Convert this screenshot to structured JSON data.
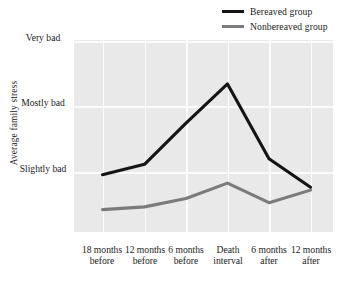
{
  "chart_data": {
    "type": "line",
    "title": "",
    "subtitle": "",
    "xlabel": "",
    "ylabel": "Average family stress",
    "grid": true,
    "legend_position": "top-right",
    "categories": [
      "18 months before",
      "12 months before",
      "6 months before",
      "Death interval",
      "6 months after",
      "12 months after"
    ],
    "x_tick_lines": [
      [
        "18 months",
        "before"
      ],
      [
        "12 months",
        "before"
      ],
      [
        "6 months",
        "before"
      ],
      [
        "Death",
        "interval"
      ],
      [
        "6 months",
        "after"
      ],
      [
        "12 months",
        "after"
      ]
    ],
    "y_tick_lines": [
      [
        "Very",
        "bad"
      ],
      [
        "Mostly",
        "bad"
      ],
      [
        "Slightly",
        "bad"
      ]
    ],
    "y_tick_values": [
      3,
      2,
      1
    ],
    "ylim": [
      0.3,
      3.05
    ],
    "series": [
      {
        "name": "Bereaved group",
        "color": "#141414",
        "values": [
          1.12,
          1.27,
          1.86,
          2.42,
          1.35,
          0.94
        ]
      },
      {
        "name": "Nonbereaved group",
        "color": "#7b7b7b",
        "values": [
          0.62,
          0.66,
          0.78,
          1.0,
          0.72,
          0.9
        ]
      }
    ],
    "legend": [
      {
        "label": "Bereaved group",
        "color": "#141414"
      },
      {
        "label": "Nonbereaved group",
        "color": "#7b7b7b"
      }
    ],
    "plot_background": "#e9e9e9",
    "gridline_color": "#fbfbfb"
  }
}
